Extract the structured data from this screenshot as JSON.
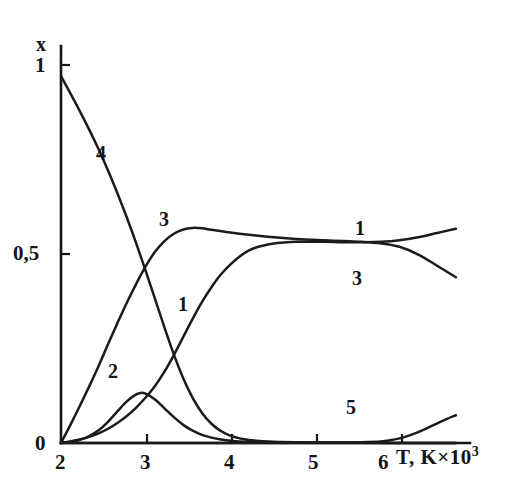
{
  "figure": {
    "background_color": "#ffffff",
    "ink_color": "#1a1a1a"
  },
  "axes": {
    "y_axis_title": "x",
    "x_axis_title_main": "T, K×10",
    "x_axis_title_exponent": "3",
    "y_ticks": [
      {
        "label": "1",
        "value": 1
      },
      {
        "label": "0,5",
        "value": 0.5
      },
      {
        "label": "0",
        "value": 0
      }
    ],
    "x_ticks": [
      {
        "label": "2",
        "value": 2
      },
      {
        "label": "3",
        "value": 3
      },
      {
        "label": "4",
        "value": 4
      },
      {
        "label": "5",
        "value": 5
      },
      {
        "label": "6",
        "value": 6
      }
    ]
  },
  "curve_labels": [
    {
      "id": "label-curve-4",
      "text": "4"
    },
    {
      "id": "label-curve-3-top",
      "text": "3"
    },
    {
      "id": "label-curve-1-middle",
      "text": "1"
    },
    {
      "id": "label-curve-2",
      "text": "2"
    },
    {
      "id": "label-curve-1-right",
      "text": "1"
    },
    {
      "id": "label-curve-3-right",
      "text": "3"
    },
    {
      "id": "label-curve-5",
      "text": "5"
    }
  ],
  "chart_data": {
    "type": "line",
    "title": "",
    "subtitle": "",
    "xlabel": "T, K×10³",
    "ylabel": "x",
    "xlim": [
      2,
      6.35
    ],
    "ylim": [
      0,
      1.03
    ],
    "xticks": [
      2,
      3,
      4,
      5,
      6
    ],
    "yticks": [
      0,
      0.5,
      1
    ],
    "ytick_labels": [
      "0",
      "0,5",
      "1"
    ],
    "grid": false,
    "legend": "inline-curve-labels",
    "series": [
      {
        "name": "1",
        "label_text": "1",
        "x": [
          2.0,
          2.1,
          2.2,
          2.3,
          2.4,
          2.5,
          2.6,
          2.7,
          2.8,
          2.9,
          3.0,
          3.1,
          3.2,
          3.3,
          3.4,
          3.5,
          3.6,
          3.7,
          3.8,
          3.9,
          4.0,
          4.1,
          4.2,
          4.3,
          4.4,
          4.5,
          4.6,
          4.8,
          5.0,
          5.2,
          5.4,
          5.6,
          5.8,
          6.0,
          6.2
        ],
        "values": [
          0.0,
          0.004,
          0.009,
          0.016,
          0.025,
          0.037,
          0.052,
          0.07,
          0.092,
          0.118,
          0.148,
          0.185,
          0.228,
          0.275,
          0.322,
          0.366,
          0.404,
          0.437,
          0.463,
          0.484,
          0.5,
          0.509,
          0.515,
          0.519,
          0.521,
          0.522,
          0.522,
          0.522,
          0.521,
          0.521,
          0.522,
          0.526,
          0.534,
          0.545,
          0.556
        ]
      },
      {
        "name": "2",
        "label_text": "2",
        "x": [
          2.0,
          2.1,
          2.2,
          2.3,
          2.4,
          2.5,
          2.6,
          2.7,
          2.8,
          2.85,
          2.9,
          3.0,
          3.1,
          3.2,
          3.3,
          3.4,
          3.5,
          3.6,
          3.7,
          3.8,
          3.9,
          4.0,
          4.2,
          4.5,
          5.0,
          5.5,
          6.0,
          6.2
        ],
        "values": [
          0.0,
          0.003,
          0.008,
          0.018,
          0.033,
          0.055,
          0.082,
          0.108,
          0.126,
          0.13,
          0.128,
          0.113,
          0.09,
          0.067,
          0.047,
          0.032,
          0.021,
          0.014,
          0.009,
          0.006,
          0.004,
          0.003,
          0.002,
          0.001,
          0.0,
          0.0,
          0.0,
          0.0
        ]
      },
      {
        "name": "3",
        "label_text": "3",
        "x": [
          2.0,
          2.1,
          2.2,
          2.3,
          2.4,
          2.5,
          2.6,
          2.7,
          2.8,
          2.9,
          3.0,
          3.1,
          3.2,
          3.3,
          3.4,
          3.5,
          3.6,
          3.8,
          4.0,
          4.2,
          4.4,
          4.6,
          4.8,
          5.0,
          5.2,
          5.4,
          5.6,
          5.8,
          6.0,
          6.2
        ],
        "values": [
          0.0,
          0.047,
          0.096,
          0.147,
          0.2,
          0.256,
          0.311,
          0.364,
          0.413,
          0.458,
          0.496,
          0.524,
          0.543,
          0.554,
          0.558,
          0.557,
          0.553,
          0.546,
          0.54,
          0.535,
          0.531,
          0.528,
          0.526,
          0.524,
          0.522,
          0.518,
          0.509,
          0.489,
          0.46,
          0.43
        ]
      },
      {
        "name": "4",
        "label_text": "4",
        "x": [
          2.0,
          2.1,
          2.2,
          2.3,
          2.4,
          2.5,
          2.6,
          2.7,
          2.8,
          2.9,
          3.0,
          3.1,
          3.2,
          3.3,
          3.4,
          3.5,
          3.6,
          3.7,
          3.8,
          3.9,
          4.0,
          4.2,
          4.5,
          5.0,
          5.5,
          6.0,
          6.2
        ],
        "values": [
          0.952,
          0.907,
          0.861,
          0.813,
          0.762,
          0.707,
          0.648,
          0.585,
          0.518,
          0.447,
          0.374,
          0.3,
          0.23,
          0.168,
          0.117,
          0.078,
          0.05,
          0.031,
          0.019,
          0.012,
          0.008,
          0.004,
          0.002,
          0.001,
          0.0,
          0.0,
          0.0
        ]
      },
      {
        "name": "5",
        "label_text": "5",
        "x": [
          2.0,
          3.0,
          4.0,
          4.5,
          5.0,
          5.2,
          5.4,
          5.5,
          5.6,
          5.7,
          5.8,
          5.9,
          6.0,
          6.1,
          6.2
        ],
        "values": [
          0.0,
          0.0,
          0.0,
          0.0,
          0.001,
          0.002,
          0.004,
          0.007,
          0.012,
          0.019,
          0.028,
          0.039,
          0.051,
          0.062,
          0.072
        ]
      }
    ]
  }
}
